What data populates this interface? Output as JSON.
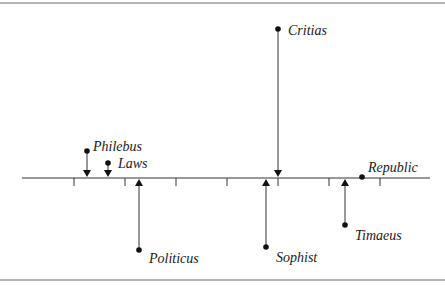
{
  "diagram": {
    "type": "timeline-displacement",
    "axis": {
      "y": 178,
      "x_start": 22,
      "x_end": 430
    },
    "ticks": [
      74,
      125,
      176,
      227,
      278,
      329,
      380
    ],
    "items": [
      {
        "label": "Philebus",
        "x": 87,
        "dot_y": 151,
        "direction": "down",
        "label_dx": 6,
        "label_dy": -4
      },
      {
        "label": "Laws",
        "x": 108,
        "dot_y": 163,
        "direction": "down",
        "label_dx": 10,
        "label_dy": 1
      },
      {
        "label": "Politicus",
        "x": 139,
        "dot_y": 250,
        "direction": "up",
        "label_dx": 10,
        "label_dy": 9
      },
      {
        "label": "Critias",
        "x": 278,
        "dot_y": 29,
        "direction": "down",
        "label_dx": 10,
        "label_dy": 2
      },
      {
        "label": "Sophist",
        "x": 266,
        "dot_y": 247,
        "direction": "up",
        "label_dx": 10,
        "label_dy": 11
      },
      {
        "label": "Timaeus",
        "x": 345,
        "dot_y": 225,
        "direction": "up",
        "label_dx": 10,
        "label_dy": 11
      },
      {
        "label": "Republic",
        "x": 362,
        "dot_y": 177,
        "direction": "none",
        "label_dx": 6,
        "label_dy": -9
      }
    ],
    "borders": {
      "top_y": 3,
      "bottom_y": 280
    }
  }
}
